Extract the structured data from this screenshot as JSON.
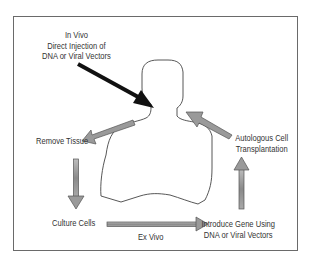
{
  "diagram": {
    "labels": {
      "in_vivo": [
        "In Vivo",
        "Direct Injection of",
        "DNA or Viral Vectors"
      ],
      "remove_tissue": "Remove Tissue",
      "culture_cells": "Culture Cells",
      "ex_vivo": "Ex Vivo",
      "introduce_gene": [
        "Introduce Gene Using",
        "DNA or Viral Vectors"
      ],
      "autologous": [
        "Autologous Cell",
        "Transplantation"
      ]
    },
    "colors": {
      "frame": "#555555",
      "in_vivo_arrow": "#111111",
      "cycle_arrow_fill": "#9a9a9a",
      "cycle_arrow_stroke": "#555555",
      "body_outline": "#444444"
    },
    "steps": [
      {
        "from": "Body",
        "to": "Remove Tissue"
      },
      {
        "from": "Remove Tissue",
        "to": "Culture Cells"
      },
      {
        "from": "Culture Cells",
        "to": "Introduce Gene Using DNA or Viral Vectors",
        "label": "Ex Vivo"
      },
      {
        "from": "Introduce Gene Using DNA or Viral Vectors",
        "to": "Autologous Cell Transplantation"
      },
      {
        "from": "Autologous Cell Transplantation",
        "to": "Body"
      }
    ]
  }
}
